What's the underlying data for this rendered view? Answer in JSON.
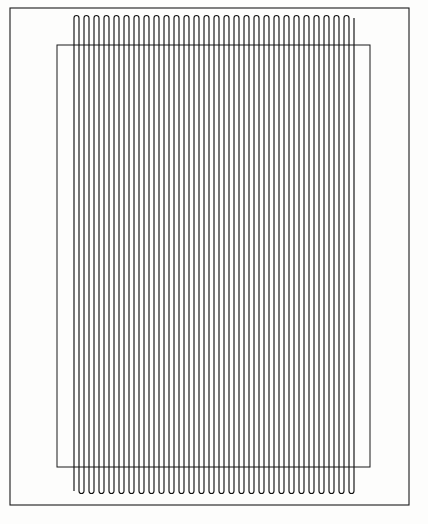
{
  "figure": {
    "background_color": "#fdfdfc",
    "line_color": "#121212",
    "frame_color": "#1a1a1a"
  },
  "outer_frame": {
    "name": "outer-border-frame",
    "x": 10,
    "y": 8,
    "width": 399,
    "height": 497,
    "stroke_width": 1.1
  },
  "inner_rect": {
    "name": "inner-substrate-rectangle",
    "x": 57,
    "y": 45,
    "width": 313,
    "height": 422,
    "stroke_width": 1.0
  },
  "chart_data": {
    "type": "line",
    "xlabel": "",
    "ylabel": "",
    "grid": false,
    "legend": null,
    "xlim": [
      74,
      356
    ],
    "ylim": [
      18,
      491
    ],
    "serpentine": {
      "segment_count": 57,
      "pitch": 5.0,
      "x_start": 74,
      "x_end": 354,
      "y_top": 18,
      "y_bottom": 491,
      "turn_radius": 2.5,
      "top_turn_y": 20.5,
      "bottom_turn_y": 488.5,
      "first_terminal": "bottom-left",
      "last_terminal": "top-right"
    }
  }
}
